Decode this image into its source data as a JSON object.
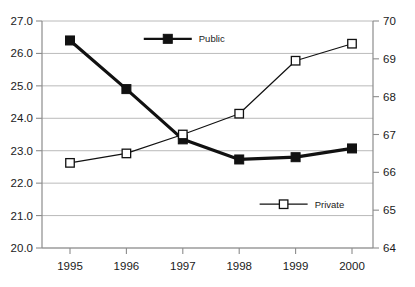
{
  "chart_data": {
    "type": "line",
    "title": "",
    "xlabel": "",
    "ylabel": "",
    "grid": true,
    "legend_position": "inside",
    "categories": [
      "1995",
      "1996",
      "1997",
      "1998",
      "1999",
      "2000"
    ],
    "x_tick_labels": [
      "1995",
      "1996",
      "1997",
      "1998",
      "1999",
      "2000"
    ],
    "left_axis": {
      "name": "left",
      "ylim": [
        20.0,
        27.0
      ],
      "tick_labels": [
        "27.0",
        "26.0",
        "25.0",
        "24.0",
        "23.0",
        "22.0",
        "21.0",
        "20.0"
      ],
      "tick_values": [
        27.0,
        26.0,
        25.0,
        24.0,
        23.0,
        22.0,
        21.0,
        20.0
      ]
    },
    "right_axis": {
      "name": "right",
      "ylim": [
        64,
        70
      ],
      "tick_labels": [
        "70",
        "69",
        "68",
        "67",
        "66",
        "65",
        "64"
      ],
      "tick_values": [
        70,
        69,
        68,
        67,
        66,
        65,
        64
      ]
    },
    "series": [
      {
        "name": "Public",
        "axis": "left",
        "marker": "filled-square",
        "color": "#111111",
        "line_width": 3.2,
        "values": [
          26.4,
          24.9,
          23.35,
          22.73,
          22.8,
          23.07
        ]
      },
      {
        "name": "Private",
        "axis": "right",
        "marker": "hollow-square",
        "color": "#111111",
        "line_width": 1.2,
        "values": [
          66.25,
          66.5,
          67.0,
          67.55,
          68.95,
          69.4
        ]
      }
    ],
    "legend": [
      {
        "label": "Public",
        "marker": "filled-square",
        "x_frac": 0.38,
        "value_on_left_axis": 26.45
      },
      {
        "label": "Private",
        "marker": "hollow-square",
        "x_frac": 0.73,
        "value_on_left_axis": 21.35
      }
    ]
  },
  "colors": {
    "background": "#ffffff",
    "grid": "#a8a8a8",
    "axis": "#8c8c8c",
    "text": "#1a1a1a",
    "series": "#111111",
    "marker_fill_hollow": "#ffffff"
  }
}
